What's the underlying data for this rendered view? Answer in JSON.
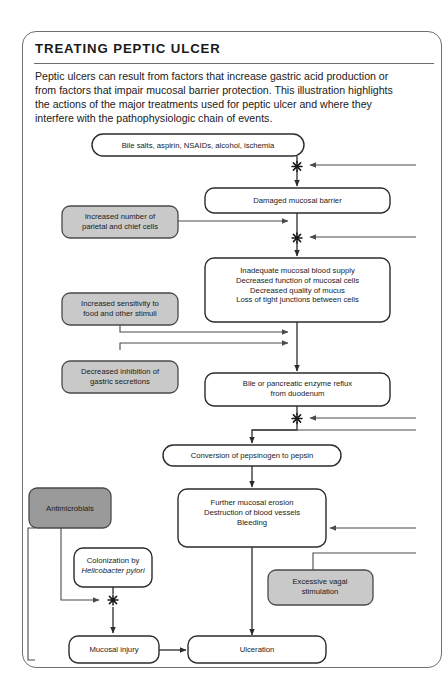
{
  "panel": {
    "title": "TREATING PEPTIC ULCER",
    "intro": "Peptic ulcers can result from factors that increase gastric acid production or from factors that impair mucosal barrier protection. This illustration highlights the actions of the major treatments used for peptic ulcer and where they interfere with the pathophysiologic chain of events."
  },
  "colors": {
    "chain_box_fill": "#ffffff",
    "chain_box_stroke": "#2b2b2b",
    "treatment_box_fill": "#c9c9c9",
    "treatment_box_stroke": "#4a4a4a",
    "antimicrobials_fill": "#9a9a9a",
    "frame_stroke": "#6f6f6f",
    "text": "#1a1a1a"
  },
  "chart_data": {
    "type": "diagram",
    "title": "TREATING PEPTIC ULCER",
    "diagram_kind": "pathophysiologic flowchart with treatment interference points",
    "chain_nodes": [
      {
        "id": "irritants",
        "label": "Bile salts, aspirin, NSAIDs, alcohol, ischemia"
      },
      {
        "id": "barrier",
        "label": "Damaged mucosal barrier"
      },
      {
        "id": "inadequate",
        "label": "Inadequate mucosal blood supply\nDecreased function of mucosal cells\nDecreased quality of mucus\nLoss of tight junctions between cells"
      },
      {
        "id": "reflux",
        "label": "Bile or pancreatic enzyme reflux\nfrom duodenum"
      },
      {
        "id": "pepsin",
        "label": "Conversion of pepsinogen to pepsin"
      },
      {
        "id": "erosion",
        "label": "Further mucosal erosion\nDestruction of blood vessels\nBleeding"
      },
      {
        "id": "hpylori",
        "label": "Colonization by\nHelicobacter pylori",
        "italic_line": 1
      },
      {
        "id": "injury",
        "label": "Mucosal injury"
      },
      {
        "id": "ulceration",
        "label": "Ulceration"
      }
    ],
    "treatment_nodes": [
      {
        "id": "parietal",
        "label": "Increased number of\nparietal and chief cells",
        "fill": "light"
      },
      {
        "id": "sensitivity",
        "label": "Increased sensitivity to\nfood and other stimuli",
        "fill": "light"
      },
      {
        "id": "inhibition",
        "label": "Decreased inhibition of\ngastric secretions",
        "fill": "light"
      },
      {
        "id": "antimicrobials",
        "label": "Antimicrobials",
        "fill": "dark"
      },
      {
        "id": "vagal",
        "label": "Excessive vagal\nstimulation",
        "fill": "light"
      }
    ],
    "interference_markers": {
      "symbol": "starburst",
      "count": 4,
      "meaning": "point where treatment interferes with the chain of events"
    },
    "edges": [
      {
        "from": "irritants",
        "to": "barrier",
        "kind": "chain"
      },
      {
        "from": "barrier",
        "to": "inadequate",
        "kind": "chain"
      },
      {
        "from": "parietal",
        "to": "chain",
        "kind": "treatment-in"
      },
      {
        "from": "sensitivity",
        "to": "chain",
        "kind": "treatment-in"
      },
      {
        "from": "inhibition",
        "to": "chain",
        "kind": "treatment-in"
      },
      {
        "from": "inadequate",
        "to": "reflux",
        "kind": "chain"
      },
      {
        "from": "reflux",
        "to": "pepsin",
        "kind": "chain"
      },
      {
        "from": "pepsin",
        "to": "erosion",
        "kind": "chain"
      },
      {
        "from": "antimicrobials",
        "to": "hpylori-junction",
        "kind": "treatment-in"
      },
      {
        "from": "hpylori",
        "to": "injury",
        "kind": "chain"
      },
      {
        "from": "injury",
        "to": "ulceration",
        "kind": "chain"
      },
      {
        "from": "erosion",
        "to": "ulceration",
        "kind": "chain"
      },
      {
        "from": "vagal",
        "to": "chain",
        "kind": "treatment-in"
      },
      {
        "from": "offscreen-right",
        "to": "irritants-junction",
        "kind": "external"
      },
      {
        "from": "offscreen-right",
        "to": "barrier-junction",
        "kind": "external"
      },
      {
        "from": "offscreen-right",
        "to": "reflux-junction",
        "kind": "external"
      },
      {
        "from": "offscreen-right",
        "to": "erosion",
        "kind": "external"
      }
    ]
  }
}
